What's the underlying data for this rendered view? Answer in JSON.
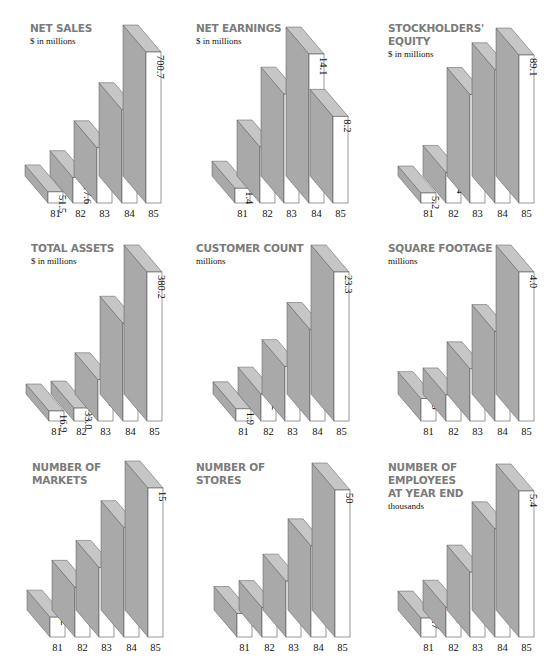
{
  "chart_data": [
    {
      "type": "bar",
      "id": "net-sales",
      "title": "NET SALES",
      "subtitle": "$ in millions",
      "categories": [
        "81",
        "82",
        "83",
        "84",
        "85"
      ],
      "values": [
        51.5,
        117.6,
        256.2,
        432.8,
        700.7
      ],
      "labels": [
        "51.5",
        "117.6",
        "256.2",
        "432.8",
        "700.7"
      ],
      "xlabel": "",
      "ylabel": "$ in millions"
    },
    {
      "type": "bar",
      "id": "net-earnings",
      "title": "NET EARNINGS",
      "subtitle": "$ in millions",
      "categories": [
        "81",
        "82",
        "83",
        "84",
        "85"
      ],
      "values": [
        1.4,
        5.3,
        10.3,
        14.1,
        8.2
      ],
      "labels": [
        "1.4",
        "5.3",
        "10.3",
        "14.1",
        "8.2"
      ],
      "xlabel": "",
      "ylabel": "$ in millions"
    },
    {
      "type": "bar",
      "id": "stockholders-equity",
      "title": "STOCKHOLDERS'\nEQUITY",
      "subtitle": "$ in millions",
      "categories": [
        "81",
        "82",
        "83",
        "84",
        "85"
      ],
      "values": [
        5.2,
        18.4,
        65.3,
        80.2,
        89.1
      ],
      "labels": [
        "5.2",
        "18.4",
        "65.3",
        "80.2",
        "89.1"
      ],
      "xlabel": "",
      "ylabel": "$ in millions"
    },
    {
      "type": "bar",
      "id": "total-assets",
      "title": "TOTAL ASSETS",
      "subtitle": "$ in millions",
      "categories": [
        "81",
        "82",
        "83",
        "84",
        "85"
      ],
      "values": [
        16.9,
        33.0,
        105.2,
        249.4,
        380.2
      ],
      "labels": [
        "16.9",
        "33.0",
        "105.2",
        "249.4",
        "380.2"
      ],
      "xlabel": "",
      "ylabel": "$ in millions"
    },
    {
      "type": "bar",
      "id": "customer-count",
      "title": "CUSTOMER COUNT",
      "subtitle": "millions",
      "categories": [
        "81",
        "82",
        "83",
        "84",
        "85"
      ],
      "values": [
        1.9,
        4.2,
        8.5,
        14.3,
        23.3
      ],
      "labels": [
        "1.9",
        "4.2",
        "8.5",
        "14.3",
        "23.3"
      ],
      "xlabel": "",
      "ylabel": "millions"
    },
    {
      "type": "bar",
      "id": "square-footage",
      "title": "SQUARE FOOTAGE",
      "subtitle": "millions",
      "categories": [
        "81",
        "82",
        "83",
        "84",
        "85"
      ],
      "values": [
        0.6,
        0.7,
        1.4,
        2.4,
        4.0
      ],
      "labels": [
        ".6",
        ".7",
        "1.4",
        "2.4",
        "4.0"
      ],
      "xlabel": "",
      "ylabel": "millions"
    },
    {
      "type": "bar",
      "id": "number-of-markets",
      "title": "NUMBER OF\nMARKETS",
      "subtitle": "",
      "categories": [
        "81",
        "82",
        "83",
        "84",
        "85"
      ],
      "values": [
        2,
        5,
        7,
        11,
        15
      ],
      "labels": [
        "2",
        "5",
        "7",
        "11",
        "15"
      ],
      "xlabel": "",
      "ylabel": ""
    },
    {
      "type": "bar",
      "id": "number-of-stores",
      "title": "NUMBER OF\nSTORES",
      "subtitle": "",
      "categories": [
        "81",
        "82",
        "83",
        "84",
        "85"
      ],
      "values": [
        8,
        10,
        19,
        31,
        50
      ],
      "labels": [
        "8",
        "10",
        "19",
        "31",
        "50"
      ],
      "xlabel": "",
      "ylabel": ""
    },
    {
      "type": "bar",
      "id": "number-of-employees",
      "title": "NUMBER OF\nEMPLOYEES\nAT YEAR END",
      "subtitle": "thousands",
      "categories": [
        "81",
        "82",
        "83",
        "84",
        "85"
      ],
      "values": [
        0.7,
        1.1,
        2.4,
        4.0,
        5.4
      ],
      "labels": [
        ".7",
        "1.1",
        "2.4",
        "4.0",
        "5.4"
      ],
      "xlabel": "",
      "ylabel": "thousands"
    }
  ],
  "colors": {
    "title": "#7b7b7b",
    "front": "#ffffff",
    "side": "#a9a9a9",
    "top": "#c6c6c6",
    "edge": "#555555",
    "text": "#111111"
  }
}
